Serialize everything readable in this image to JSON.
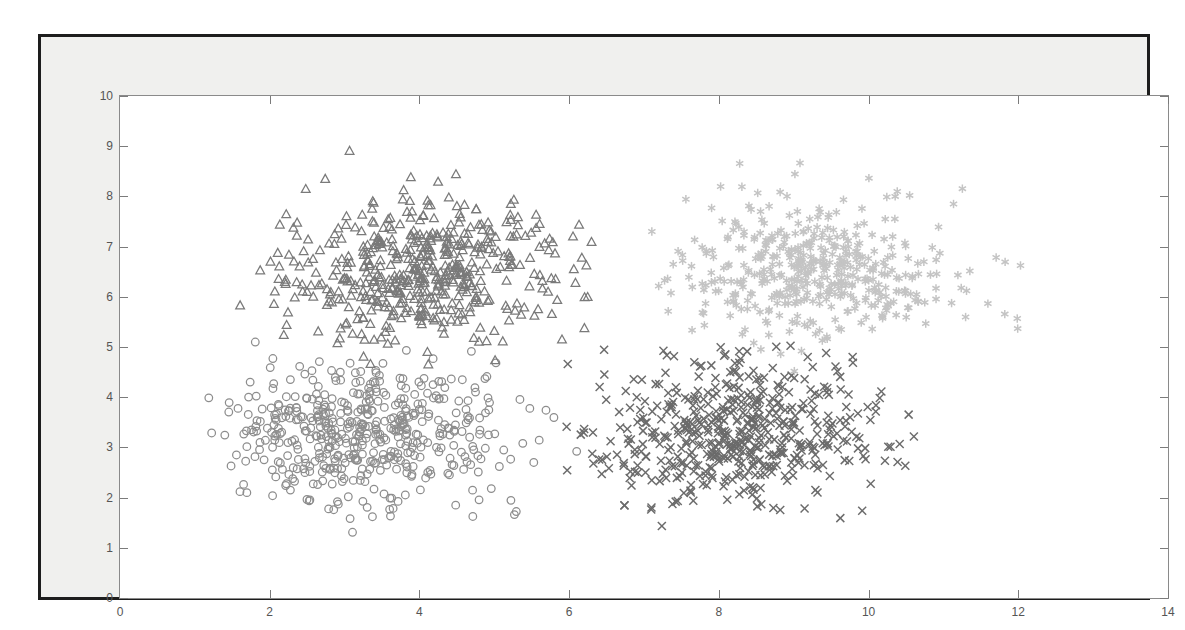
{
  "figure": {
    "background_color": "#f0f0ee",
    "frame_color": "#1d1d1d",
    "plot_background": "#ffffff",
    "axis_color": "#8a8a8a"
  },
  "chart_data": {
    "type": "scatter",
    "title": "",
    "xlabel": "",
    "ylabel": "",
    "xlim": [
      0,
      14
    ],
    "ylim": [
      0,
      10
    ],
    "xticks": [
      0,
      2,
      4,
      6,
      8,
      10,
      12,
      14
    ],
    "yticks": [
      0,
      1,
      2,
      3,
      4,
      5,
      6,
      7,
      8,
      9,
      10
    ],
    "grid": false,
    "legend": null,
    "legend_position": "none",
    "n_points_total": 2000,
    "series": [
      {
        "name": "cluster-1",
        "marker": "circle",
        "color": "#8d8d8d",
        "n": 500,
        "center": [
          3.3,
          3.25
        ],
        "spread": [
          0.95,
          0.72
        ],
        "x_range": [
          1.05,
          6.2
        ],
        "y_range": [
          1.25,
          5.2
        ],
        "seed": 11
      },
      {
        "name": "cluster-2",
        "marker": "triangle",
        "color": "#7a7a7a",
        "n": 520,
        "center": [
          4.1,
          6.55
        ],
        "spread": [
          0.88,
          0.7
        ],
        "x_range": [
          1.3,
          6.6
        ],
        "y_range": [
          4.6,
          9.05
        ],
        "seed": 29
      },
      {
        "name": "cluster-3",
        "marker": "cross",
        "color": "#6b6b6b",
        "n": 520,
        "center": [
          8.3,
          3.3
        ],
        "spread": [
          0.95,
          0.68
        ],
        "x_range": [
          5.9,
          11.0
        ],
        "y_range": [
          0.9,
          5.3
        ],
        "seed": 47
      },
      {
        "name": "cluster-4",
        "marker": "star",
        "color": "#c4c4c4",
        "n": 460,
        "center": [
          9.3,
          6.55
        ],
        "spread": [
          0.95,
          0.68
        ],
        "x_range": [
          7.1,
          12.2
        ],
        "y_range": [
          4.4,
          8.7
        ],
        "seed": 83
      }
    ]
  }
}
